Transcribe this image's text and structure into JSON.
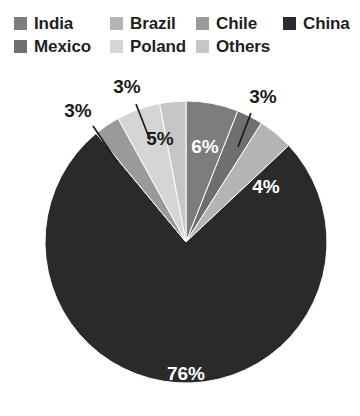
{
  "legend": {
    "items": [
      {
        "label": "India",
        "color": "#7d7d7d",
        "swatch_name": "legend-swatch-india",
        "col": 0,
        "row": 0
      },
      {
        "label": "Mexico",
        "color": "#6f6f6f",
        "swatch_name": "legend-swatch-mexico",
        "col": 0,
        "row": 1
      },
      {
        "label": "Brazil",
        "color": "#b4b4b4",
        "swatch_name": "legend-swatch-brazil",
        "col": 1,
        "row": 0
      },
      {
        "label": "Poland",
        "color": "#d5d5d5",
        "swatch_name": "legend-swatch-poland",
        "col": 1,
        "row": 1
      },
      {
        "label": "Chile",
        "color": "#9a9a9a",
        "swatch_name": "legend-swatch-chile",
        "col": 2,
        "row": 0
      },
      {
        "label": "Others",
        "color": "#c6c6c6",
        "swatch_name": "legend-swatch-others",
        "col": 2,
        "row": 1
      },
      {
        "label": "China",
        "color": "#2b2a2a",
        "swatch_name": "legend-swatch-china",
        "col": 3,
        "row": 0
      }
    ]
  },
  "chart_data": {
    "type": "pie",
    "title": "",
    "subtitle": "",
    "xlabel": "",
    "ylabel": "",
    "grid": false,
    "legend_position": "top",
    "unit": "%",
    "total": 100,
    "start_angle_deg": 0,
    "direction": "clockwise",
    "categories": [
      "India",
      "Mexico",
      "Brazil",
      "China",
      "Chile",
      "Poland",
      "Others"
    ],
    "values": [
      6,
      3,
      4,
      76,
      3,
      5,
      3
    ],
    "colors": [
      "#7d7d7d",
      "#6f6f6f",
      "#b4b4b4",
      "#2b2a2a",
      "#9a9a9a",
      "#d5d5d5",
      "#c6c6c6"
    ],
    "slices": [
      {
        "name": "India",
        "value": 6,
        "label": "6%",
        "color": "#7d7d7d",
        "label_placement": "inside",
        "label_color": "#ffffff",
        "start_deg": 0,
        "end_deg": 21.6,
        "label_x": 205,
        "label_y": 148
      },
      {
        "name": "Mexico",
        "value": 3,
        "label": "3%",
        "color": "#6f6f6f",
        "label_placement": "outside",
        "label_color": "#1c1b1b",
        "start_deg": 21.6,
        "end_deg": 32.4,
        "label_x": 263,
        "label_y": 98,
        "leader_x1": 251,
        "leader_y1": 113,
        "leader_x2": 238,
        "leader_y2": 147
      },
      {
        "name": "Brazil",
        "value": 4,
        "label": "4%",
        "color": "#b4b4b4",
        "label_placement": "inside",
        "label_color": "#ffffff",
        "start_deg": 32.4,
        "end_deg": 46.8,
        "label_x": 266,
        "label_y": 188
      },
      {
        "name": "China",
        "value": 76,
        "label": "76%",
        "color": "#2b2a2a",
        "label_placement": "inside",
        "label_color": "#ffffff",
        "start_deg": 46.8,
        "end_deg": 320.4,
        "label_x": 186,
        "label_y": 375
      },
      {
        "name": "Chile",
        "value": 3,
        "label": "3%",
        "color": "#9a9a9a",
        "label_placement": "outside",
        "label_color": "#1c1b1b",
        "start_deg": 320.4,
        "end_deg": 331.2,
        "label_x": 78,
        "label_y": 112,
        "leader_x1": 93,
        "leader_y1": 126,
        "leader_x2": 118,
        "leader_y2": 163
      },
      {
        "name": "Poland",
        "value": 5,
        "label": "5%",
        "color": "#d5d5d5",
        "label_placement": "inside",
        "label_color": "#1c1b1b",
        "start_deg": 331.2,
        "end_deg": 349.2,
        "label_x": 160,
        "label_y": 140
      },
      {
        "name": "Others",
        "value": 3,
        "label": "3%",
        "color": "#c6c6c6",
        "label_placement": "outside",
        "label_color": "#1c1b1b",
        "start_deg": 349.2,
        "end_deg": 360,
        "label_x": 127,
        "label_y": 88,
        "leader_x1": 136,
        "leader_y1": 104,
        "leader_x2": 150,
        "leader_y2": 140
      }
    ],
    "geometry": {
      "cx": 186,
      "cy": 184,
      "r": 141
    }
  }
}
